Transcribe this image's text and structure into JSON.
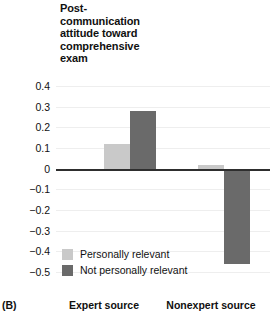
{
  "panel": {
    "label": "(B)"
  },
  "chart_data": {
    "type": "bar",
    "xlabel": "",
    "ylabel": "Post-communication attitude toward comprehensive exam",
    "categories": [
      "Expert source",
      "Nonexpert source"
    ],
    "series": [
      {
        "name": "Personally relevant",
        "color": "#c9c9c9",
        "values": [
          0.12,
          0.02
        ]
      },
      {
        "name": "Not personally relevant",
        "color": "#6a6a6a",
        "values": [
          0.28,
          -0.46
        ]
      }
    ],
    "ylim": [
      -0.5,
      0.4
    ],
    "ytick_values": [
      0.4,
      0.3,
      0.2,
      0.1,
      0,
      -0.1,
      -0.2,
      -0.3,
      -0.4,
      -0.5
    ],
    "ytick_labels": [
      "0.4",
      "0.3",
      "0.2",
      "0.1",
      "0",
      "−0.1",
      "−0.2",
      "−0.3",
      "−0.4",
      "−0.5"
    ],
    "grid": true,
    "legend_position": "inside-lower-left",
    "zero_line": true
  },
  "axis_title_lines": [
    "Post-",
    "communication",
    "attitude toward",
    "comprehensive",
    "exam"
  ],
  "legend": {
    "entries": [
      {
        "label": "Personally relevant",
        "color": "#c9c9c9"
      },
      {
        "label": "Not personally relevant",
        "color": "#6a6a6a"
      }
    ]
  },
  "colors": {
    "light_gray": "#c9c9c9",
    "dark_gray": "#6a6a6a",
    "grid": "#eeeeee",
    "axis": "#2e2e2e",
    "text": "#101010",
    "background": "#ffffff"
  }
}
